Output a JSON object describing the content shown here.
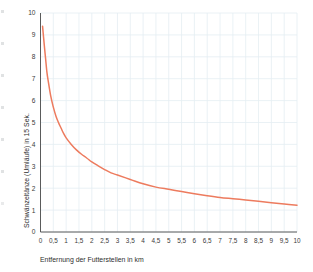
{
  "chart_data": {
    "type": "line",
    "title": "",
    "xlabel": "Entfernung der Futterstellen in km",
    "ylabel": "Schwänzeltänze (Umläufe) in 15 Sek.",
    "xlim": [
      0,
      10
    ],
    "ylim": [
      0,
      10
    ],
    "grid": true,
    "legend": "none",
    "line_color": "#ED7B5E",
    "grid_color": "#E4EEF2",
    "axis_color": "#4a4a4a",
    "background_color": "#FFFFFF",
    "xticks": [
      "0",
      "0,5",
      "1",
      "1,5",
      "2",
      "2,5",
      "3",
      "3,5",
      "4",
      "4,5",
      "5",
      "5,5",
      "6",
      "6,5",
      "7",
      "7,5",
      "8",
      "8,5",
      "9",
      "9,5",
      "10"
    ],
    "xtick_values": [
      0,
      0.5,
      1,
      1.5,
      2,
      2.5,
      3,
      3.5,
      4,
      4.5,
      5,
      5.5,
      6,
      6.5,
      7,
      7.5,
      8,
      8.5,
      9,
      9.5,
      10
    ],
    "yticks": [
      "0",
      "1",
      "2",
      "3",
      "4",
      "5",
      "6",
      "7",
      "8",
      "9",
      "10"
    ],
    "ytick_values": [
      0,
      1,
      2,
      3,
      4,
      5,
      6,
      7,
      8,
      9,
      10
    ],
    "series": [
      {
        "name": "Schwänzeltanz-Frequenz",
        "x": [
          0.08,
          0.15,
          0.2,
          0.25,
          0.3,
          0.4,
          0.5,
          0.6,
          0.7,
          0.8,
          0.9,
          1.0,
          1.2,
          1.4,
          1.6,
          1.8,
          2.0,
          2.25,
          2.5,
          2.75,
          3.0,
          3.5,
          4.0,
          4.5,
          5.0,
          5.5,
          6.0,
          6.5,
          7.0,
          7.5,
          8.0,
          8.5,
          9.0,
          9.5,
          10.0
        ],
        "y": [
          9.4,
          8.5,
          7.9,
          7.3,
          6.9,
          6.2,
          5.7,
          5.3,
          5.0,
          4.75,
          4.5,
          4.3,
          4.0,
          3.75,
          3.55,
          3.38,
          3.2,
          3.02,
          2.85,
          2.7,
          2.6,
          2.4,
          2.2,
          2.05,
          1.95,
          1.85,
          1.75,
          1.66,
          1.58,
          1.52,
          1.46,
          1.4,
          1.34,
          1.28,
          1.22
        ]
      }
    ]
  }
}
